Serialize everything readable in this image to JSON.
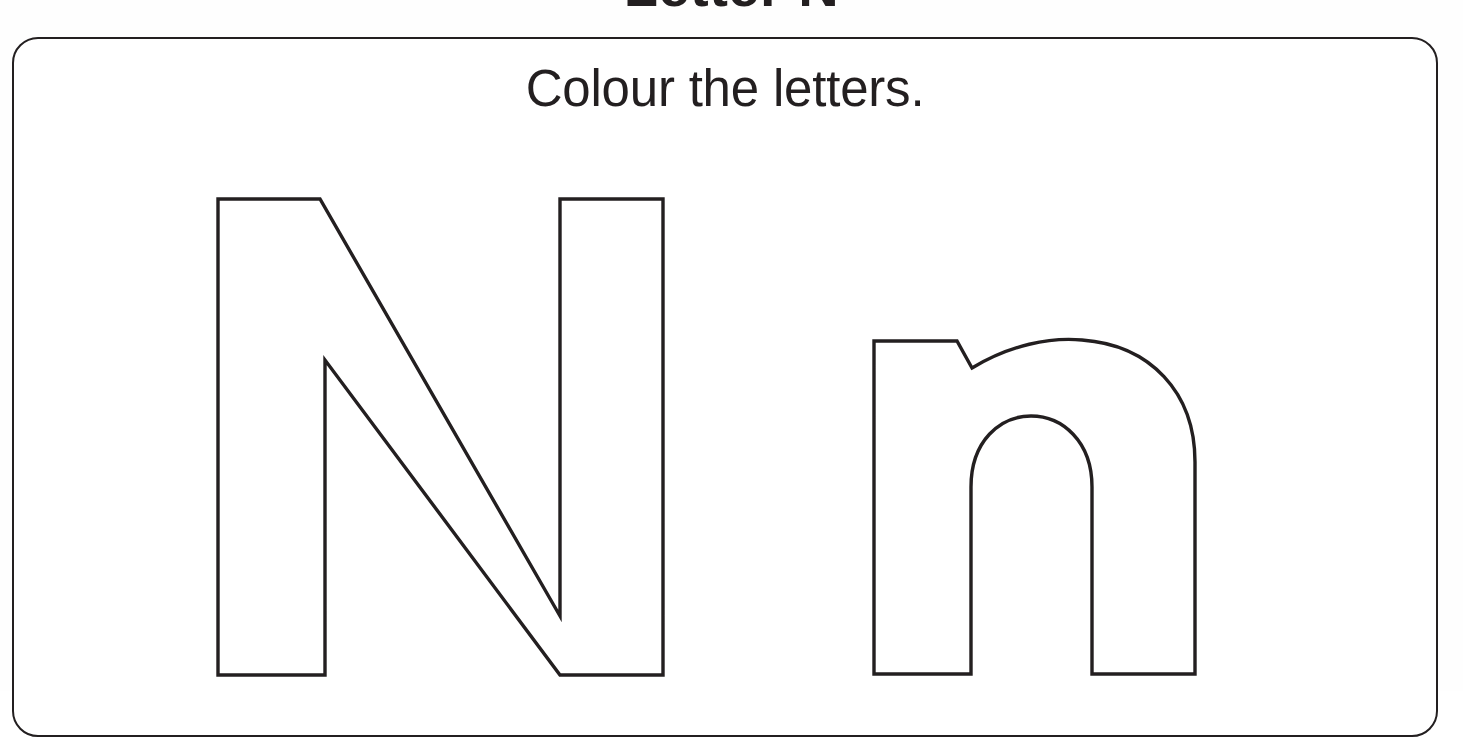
{
  "page": {
    "heading": "Letter N",
    "background_color": "#fefefe",
    "ink_color": "#231f20"
  },
  "card": {
    "instruction": "Colour the letters.",
    "border_color": "#231f20",
    "fill_color": "#ffffff",
    "corner_radius": 26
  },
  "letters": {
    "uppercase": {
      "character": "N",
      "name": "uppercase-letter-n-outline",
      "stroke_color": "#231f20",
      "fill_color": "#ffffff",
      "path": "M 218 199 L 320 199 L 560 616 L 560 199 L 663 199 L 663 675 L 560 675 L 325 360 L 325 675 L 218 675 Z"
    },
    "lowercase": {
      "character": "n",
      "name": "lowercase-letter-n-outline",
      "stroke_color": "#231f20",
      "fill_color": "#ffffff",
      "path": "M 874 341 L 957 341 L 972 368 C 1010 345 1050 337 1082 340 C 1150 345 1195 392 1195 462 L 1195 674 L 1092 674 L 1092 487 C 1092 441 1062 416 1031 416 C 1000 416 971 441 971 487 L 971 674 L 874 674 Z"
    }
  }
}
